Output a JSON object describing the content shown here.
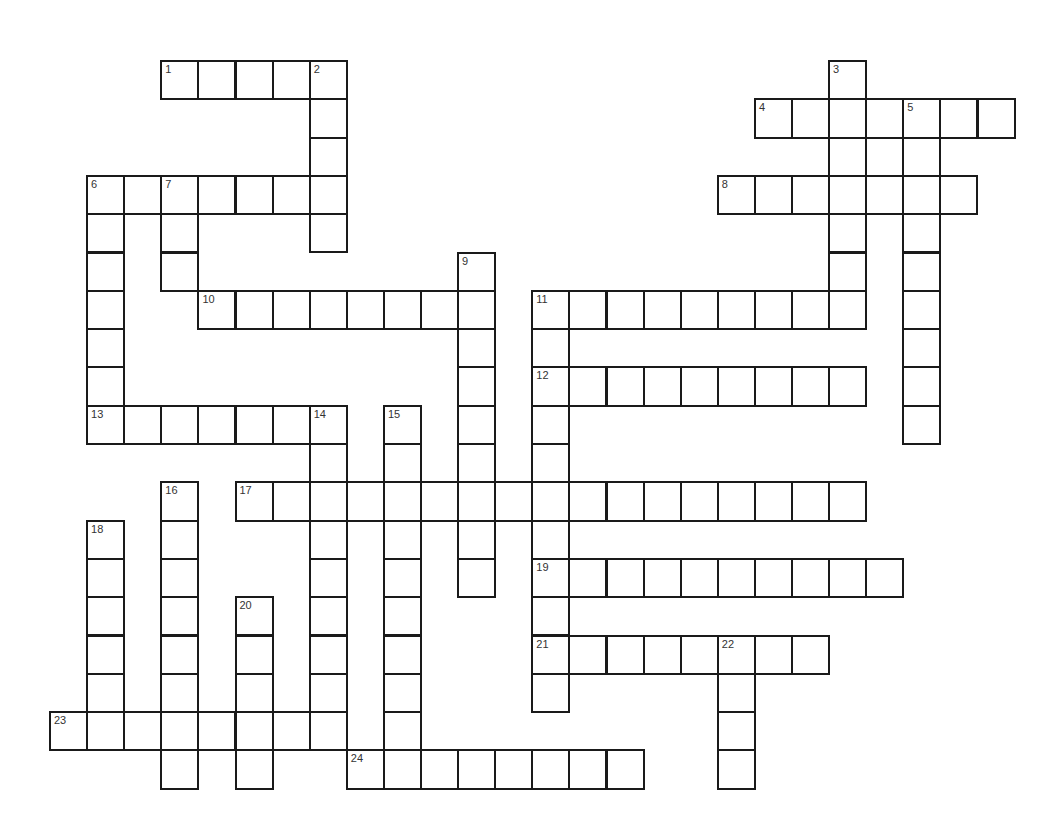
{
  "puzzle": {
    "type": "crossword",
    "cols": 26,
    "rows": 19,
    "origin_x": 50,
    "origin_y": 61,
    "cell_w": 37.1,
    "cell_h": 38.3,
    "line_color": "#1a1a1a",
    "number_color": "#333333"
  },
  "entries": [
    {
      "num": "1",
      "dir": "across",
      "row": 0,
      "col": 3,
      "len": 5
    },
    {
      "num": "2",
      "dir": "down",
      "row": 0,
      "col": 7,
      "len": 5
    },
    {
      "num": "3",
      "dir": "down",
      "row": 0,
      "col": 21,
      "len": 7
    },
    {
      "num": "4",
      "dir": "across",
      "row": 1,
      "col": 19,
      "len": 7
    },
    {
      "num": "5",
      "dir": "down",
      "row": 1,
      "col": 23,
      "len": 9
    },
    {
      "num": "6",
      "dir": "across",
      "row": 3,
      "col": 1,
      "len": 7
    },
    {
      "num": "6",
      "dir": "down",
      "row": 3,
      "col": 1,
      "len": 7
    },
    {
      "num": "7",
      "dir": "down",
      "row": 3,
      "col": 3,
      "len": 3
    },
    {
      "num": "8",
      "dir": "across",
      "row": 3,
      "col": 18,
      "len": 7
    },
    {
      "num": "9",
      "dir": "down",
      "row": 5,
      "col": 11,
      "len": 9
    },
    {
      "num": "10",
      "dir": "across",
      "row": 6,
      "col": 4,
      "len": 8
    },
    {
      "num": "11",
      "dir": "across",
      "row": 6,
      "col": 13,
      "len": 9
    },
    {
      "num": "11",
      "dir": "down",
      "row": 6,
      "col": 13,
      "len": 11
    },
    {
      "num": "12",
      "dir": "across",
      "row": 8,
      "col": 13,
      "len": 9
    },
    {
      "num": "13",
      "dir": "across",
      "row": 9,
      "col": 1,
      "len": 7
    },
    {
      "num": "14",
      "dir": "down",
      "row": 9,
      "col": 7,
      "len": 9
    },
    {
      "num": "15",
      "dir": "down",
      "row": 9,
      "col": 9,
      "len": 10
    },
    {
      "num": "16",
      "dir": "down",
      "row": 11,
      "col": 3,
      "len": 8
    },
    {
      "num": "17",
      "dir": "across",
      "row": 11,
      "col": 5,
      "len": 17
    },
    {
      "num": "18",
      "dir": "down",
      "row": 12,
      "col": 1,
      "len": 6
    },
    {
      "num": "19",
      "dir": "across",
      "row": 13,
      "col": 13,
      "len": 10
    },
    {
      "num": "20",
      "dir": "down",
      "row": 14,
      "col": 5,
      "len": 5
    },
    {
      "num": "21",
      "dir": "across",
      "row": 15,
      "col": 13,
      "len": 8
    },
    {
      "num": "22",
      "dir": "down",
      "row": 15,
      "col": 18,
      "len": 4
    },
    {
      "num": "23",
      "dir": "across",
      "row": 17,
      "col": 0,
      "len": 8
    },
    {
      "num": "24",
      "dir": "across",
      "row": 18,
      "col": 8,
      "len": 8
    }
  ]
}
